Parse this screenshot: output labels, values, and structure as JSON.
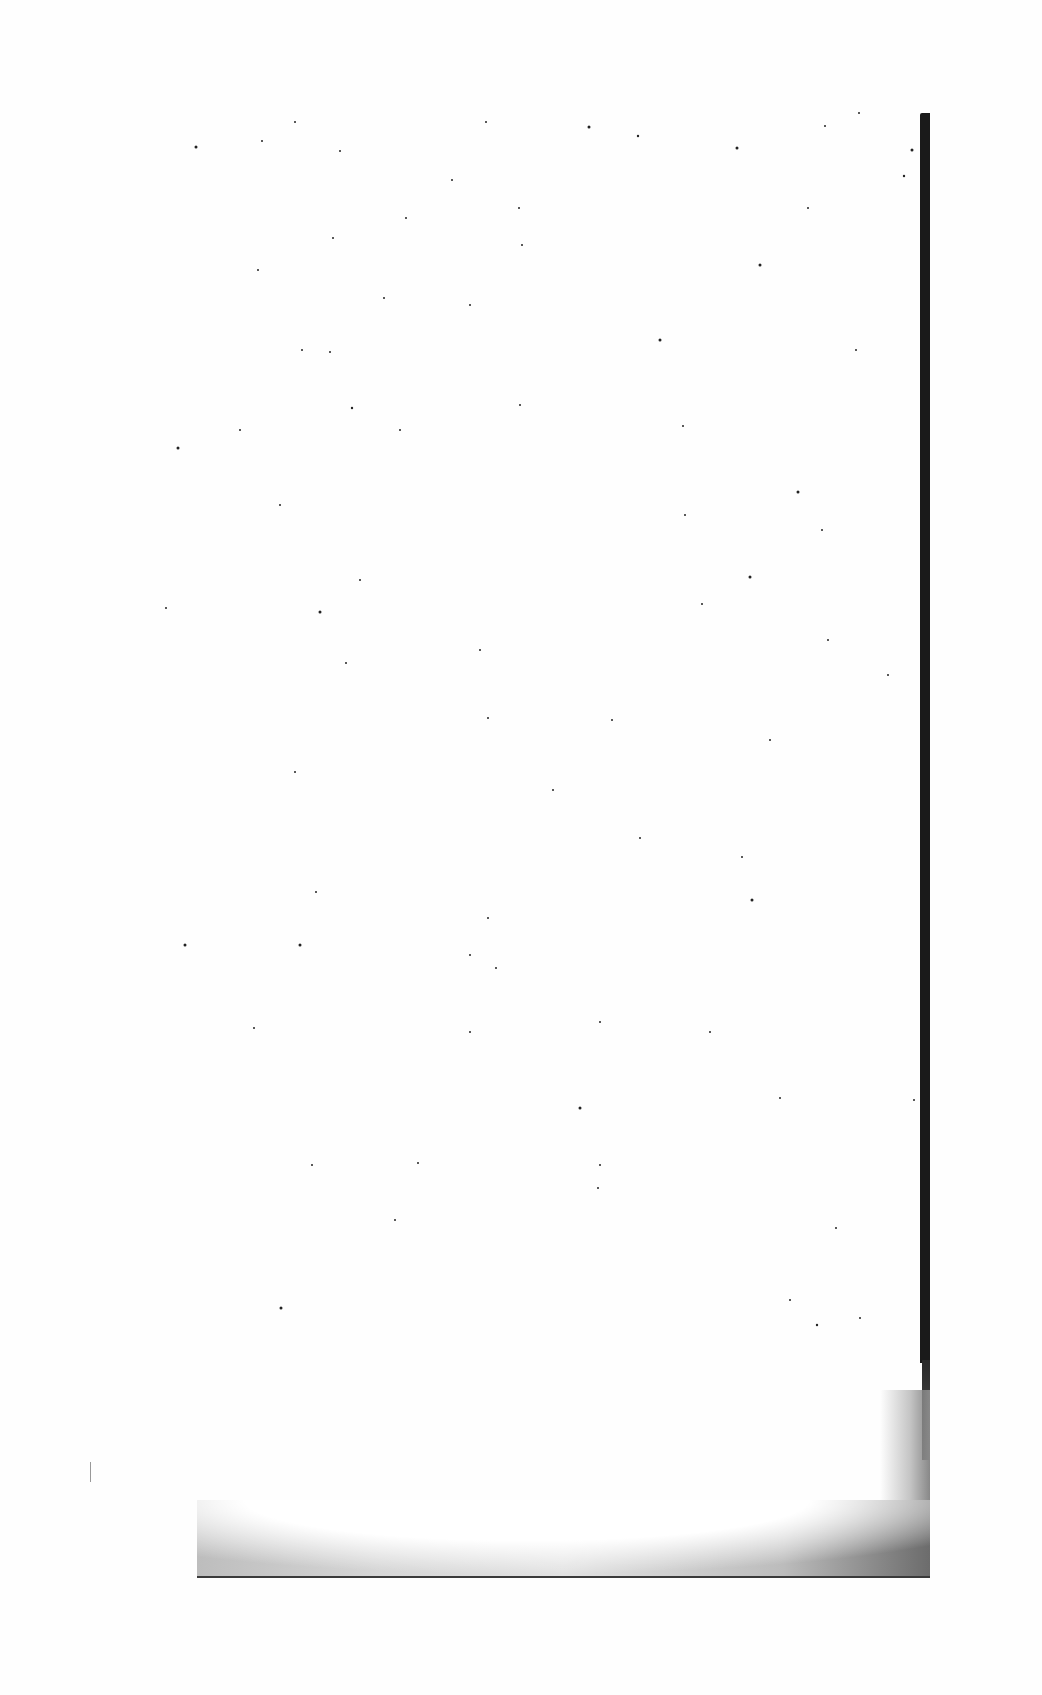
{
  "document": {
    "type": "scanned-blank-page",
    "text_content": "",
    "colors": {
      "paper": "#fefefe",
      "edge": "#1a1a1a",
      "shadow": "#bdbdbd"
    }
  }
}
